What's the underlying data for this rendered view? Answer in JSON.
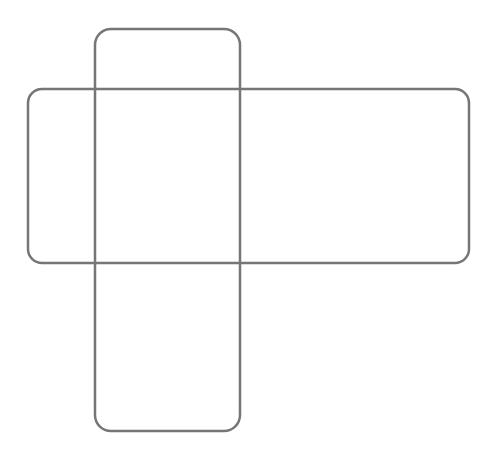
{
  "canvas": {
    "width": 497,
    "height": 452,
    "background": "#ffffff"
  },
  "style": {
    "stroke": "#767676",
    "stroke_width": 2.5,
    "fill": "none"
  },
  "shapes": [
    {
      "name": "horizontal-rounded-rectangle",
      "x": 28,
      "y": 89,
      "width": 441,
      "height": 174,
      "rx": 14
    },
    {
      "name": "vertical-rounded-rectangle",
      "x": 95,
      "y": 29,
      "width": 145,
      "height": 402,
      "rx": 16
    }
  ]
}
